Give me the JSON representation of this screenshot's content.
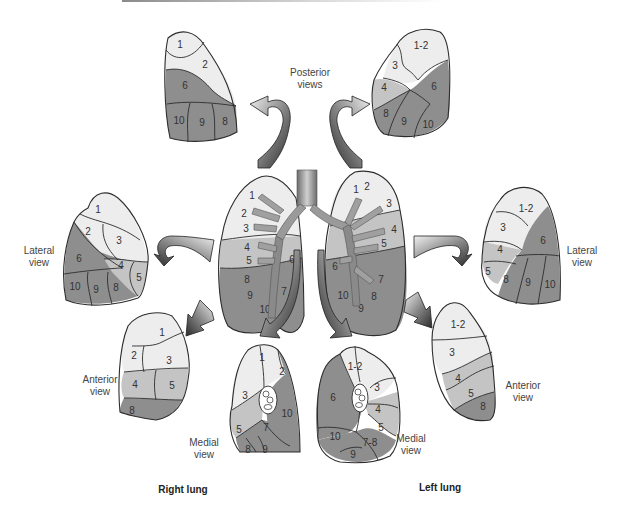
{
  "figure": {
    "colors": {
      "light": "#ededed",
      "medium": "#c4c4c4",
      "dark": "#8e8e8e",
      "outline": "#2c2c2c",
      "bronchi": "#9a9a9a"
    },
    "captions": {
      "posterior": [
        "Posterior",
        "views"
      ],
      "right_lateral": [
        "Lateral",
        "view"
      ],
      "left_lateral": [
        "Lateral",
        "view"
      ],
      "right_anterior": [
        "Anterior",
        "view"
      ],
      "left_anterior": [
        "Anterior",
        "view"
      ],
      "right_medial": [
        "Medial",
        "view"
      ],
      "left_medial": [
        "Medial",
        "view"
      ]
    },
    "lung_titles": {
      "right": "Right lung",
      "left": "Left lung"
    },
    "right_lung": {
      "posterior_view": [
        "1",
        "2",
        "6",
        "10",
        "9",
        "8"
      ],
      "lateral_view": [
        "1",
        "2",
        "3",
        "6",
        "4",
        "5",
        "10",
        "9",
        "8"
      ],
      "anterior_view": [
        "1",
        "2",
        "3",
        "4",
        "5",
        "8"
      ],
      "medial_view": [
        "1",
        "2",
        "3",
        "10",
        "5",
        "7",
        "8",
        "9"
      ],
      "central_bronchi_labels": [
        "1",
        "2",
        "3",
        "4",
        "5",
        "6",
        "8",
        "9",
        "7",
        "10"
      ]
    },
    "left_lung": {
      "posterior_view": [
        "1-2",
        "3",
        "4",
        "6",
        "8",
        "9",
        "10"
      ],
      "lateral_view": [
        "1-2",
        "3",
        "4",
        "6",
        "5",
        "8",
        "9",
        "10"
      ],
      "anterior_view": [
        "1-2",
        "3",
        "4",
        "5",
        "8"
      ],
      "medial_view": [
        "1-2",
        "3",
        "6",
        "4",
        "5",
        "10",
        "7-8",
        "9"
      ],
      "central_bronchi_labels": [
        "1",
        "2",
        "3",
        "4",
        "5",
        "6",
        "7",
        "8",
        "9",
        "10"
      ]
    }
  }
}
